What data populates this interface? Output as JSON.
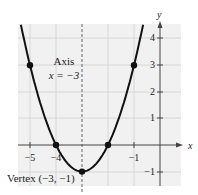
{
  "chart_data": {
    "type": "line",
    "title": "",
    "function": "y = (x + 3)^2 - 1",
    "xlabel": "x",
    "ylabel": "y",
    "xlim": [
      -5.5,
      0.6
    ],
    "ylim": [
      -1.5,
      4.5
    ],
    "grid": true,
    "x_ticks": [
      -5,
      -4,
      -1
    ],
    "x_tick_labels": [
      "−5",
      "−4",
      "−1"
    ],
    "y_ticks": [
      4,
      3,
      2,
      1,
      -1
    ],
    "y_tick_labels": [
      "4",
      "3",
      "2",
      "1",
      "−1"
    ],
    "points": [
      {
        "x": -5,
        "y": 3
      },
      {
        "x": -4,
        "y": 0
      },
      {
        "x": -3,
        "y": -1
      },
      {
        "x": -2,
        "y": 0
      },
      {
        "x": -1,
        "y": 3
      }
    ],
    "axis_of_symmetry": {
      "x": -3,
      "label_line1": "Axis",
      "label_line2": "x = −3"
    },
    "vertex": {
      "x": -3,
      "y": -1,
      "label": "Vertex (−3, −1)"
    },
    "colors": {
      "curve": "#111111",
      "grid": "#d8d8d8",
      "background": "#efefef",
      "axis": "#444444"
    }
  }
}
